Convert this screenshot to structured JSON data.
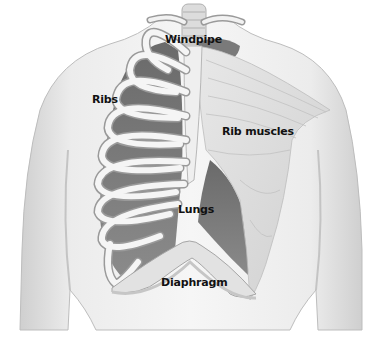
{
  "diagram": {
    "labels": {
      "windpipe": "Windpipe",
      "ribs": "Ribs",
      "rib_muscles": "Rib muscles",
      "lungs": "Lungs",
      "diaphragm": "Diaphragm"
    },
    "colors": {
      "background": "#ffffff",
      "body": "#e6e6e6",
      "body_shadow": "#c9c9c9",
      "lung": "#7d7d7d",
      "lung_dark": "#5e5e5e",
      "rib": "#f4f4f4",
      "rib_outline": "#9a9a9a",
      "muscle": "#dadada",
      "label_text": "#111111"
    }
  }
}
